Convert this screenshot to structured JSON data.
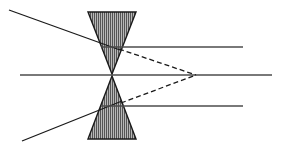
{
  "figure": {
    "width": 281,
    "height": 149,
    "background": "#ffffff"
  },
  "colors": {
    "stroke": "#1a1a1a",
    "axis": "#4d4d4d",
    "ray": "#1a1a1a",
    "dashed_ray": "#1a1a1a",
    "prism_fill": "#b3b3b3",
    "prism_hatch": "#4d4d4d",
    "prism_outline": "#1a1a1a"
  },
  "optical_axis": {
    "label": "optical-axis",
    "x1": 20,
    "y1": 75,
    "x2": 272,
    "y2": 75,
    "stroke_width": 1.4,
    "style": "solid"
  },
  "focal_point": {
    "label": "focal-point",
    "x": 196,
    "y": 75
  },
  "prisms": [
    {
      "name": "upper-prism",
      "orientation": "apex-down",
      "points": "88,12 136,12 112,74",
      "base_y": 12,
      "apex_x": 112,
      "apex_y": 74,
      "left_x": 88,
      "right_x": 136
    },
    {
      "name": "lower-prism",
      "orientation": "apex-up",
      "points": "88,139 136,139 112,76",
      "base_y": 139,
      "apex_x": 112,
      "apex_y": 76,
      "left_x": 88,
      "right_x": 136
    }
  ],
  "incident_rays": [
    {
      "name": "upper-incident-ray",
      "x1": 9,
      "y1": 10,
      "x2": 120,
      "y2": 50,
      "style": "solid",
      "stroke_width": 1.3
    },
    {
      "name": "lower-incident-ray",
      "x1": 22,
      "y1": 141,
      "x2": 122,
      "y2": 101,
      "style": "solid",
      "stroke_width": 1.3
    }
  ],
  "horizontal_rays": [
    {
      "name": "upper-horizontal-ray",
      "x1": 101,
      "y1": 47,
      "x2": 243,
      "y2": 47,
      "style": "solid",
      "stroke_width": 1.3
    },
    {
      "name": "lower-horizontal-ray",
      "x1": 101,
      "y1": 106,
      "x2": 243,
      "y2": 106,
      "style": "solid",
      "stroke_width": 1.3
    }
  ],
  "dashed_rays": [
    {
      "name": "upper-dashed-converging-ray",
      "x1": 119,
      "y1": 49,
      "x2": 196,
      "y2": 75,
      "style": "dashed",
      "dash_pattern": "5,3",
      "stroke_width": 1.3
    },
    {
      "name": "lower-dashed-converging-ray",
      "x1": 121,
      "y1": 103,
      "x2": 196,
      "y2": 75,
      "style": "dashed",
      "dash_pattern": "5,3",
      "stroke_width": 1.3
    }
  ],
  "hatching": {
    "name": "vertical-hatch-pattern",
    "direction": "vertical",
    "spacing": 2,
    "line_width": 1
  }
}
